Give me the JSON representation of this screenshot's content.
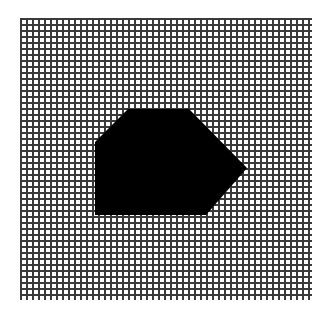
{
  "figure": {
    "type": "pixel-grid",
    "background": "#ffffff",
    "line_color": "#3a3a3a",
    "fill_color": "#000000",
    "grid": {
      "x0": 20,
      "y0": 18,
      "x1": 310,
      "y1": 298,
      "pitch": 6,
      "line_width": 2
    },
    "shape": {
      "name": "filled-polygon",
      "points": [
        [
          95,
          142
        ],
        [
          128,
          109
        ],
        [
          189,
          109
        ],
        [
          247,
          168
        ],
        [
          206,
          215
        ],
        [
          95,
          215
        ]
      ]
    }
  }
}
